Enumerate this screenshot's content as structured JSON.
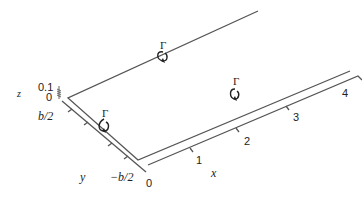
{
  "diagram": {
    "type": "horseshoe-vortex-3d",
    "colors": {
      "line": "#555555",
      "text": "#222222",
      "background": "#ffffff"
    },
    "axes": {
      "x": {
        "label": "x",
        "ticks": [
          "0",
          "1",
          "2",
          "3",
          "4"
        ]
      },
      "y": {
        "label": "y",
        "ticks": [
          "b/2",
          "−b/2"
        ]
      },
      "z": {
        "label": "z",
        "ticks": [
          "0.1",
          "0"
        ]
      }
    },
    "vortices": [
      {
        "name": "trailing-vortex-top",
        "circulation_label": "Γ"
      },
      {
        "name": "bound-vortex",
        "circulation_label": "Γ"
      },
      {
        "name": "trailing-vortex-bottom",
        "circulation_label": "Γ"
      }
    ]
  }
}
